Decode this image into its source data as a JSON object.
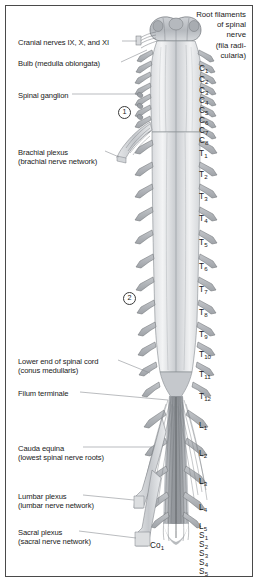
{
  "figure": {
    "border_color": "#4a4a4a",
    "background": "#ffffff",
    "ink_color": "#1a1a1a",
    "structure_fill": "#b9bcc0",
    "structure_light": "#e3e5e7",
    "leader_color": "#7b7f84"
  },
  "header": {
    "lines": [
      "Root filaments",
      "of spinal",
      "nerve",
      "(fila radi-",
      "cularia)"
    ]
  },
  "callouts": [
    {
      "name": "cranial-nerves",
      "lines": [
        "Cranial nerves IX, X, and XI"
      ],
      "x": 18,
      "y": 38,
      "leader_from": 146,
      "leader_to": 160,
      "leader_y": 41
    },
    {
      "name": "bulb",
      "lines": [
        "Bulb (medulla oblongata)"
      ],
      "x": 18,
      "y": 59,
      "leader_from": 129,
      "leader_to": 158,
      "leader_y": 62
    },
    {
      "name": "spinal-ganglion",
      "lines": [
        "Spinal ganglion"
      ],
      "x": 18,
      "y": 91,
      "leader_from": 80,
      "leader_to": 146,
      "leader_y": 94
    },
    {
      "name": "brachial-plexus",
      "lines": [
        "Brachial plexus",
        "(brachial nerve network)"
      ],
      "x": 18,
      "y": 148,
      "leader_from": 113,
      "leader_to": 137,
      "leader_y": 151
    },
    {
      "name": "conus-medullaris",
      "lines": [
        "Lower end of spinal cord",
        "(conus medullaris)"
      ],
      "x": 18,
      "y": 357,
      "leader_from": 126,
      "leader_to": 148,
      "leader_y": 360
    },
    {
      "name": "filum-terminale",
      "lines": [
        "Filum terminale"
      ],
      "x": 18,
      "y": 389,
      "leader_from": 85,
      "leader_to": 152,
      "leader_y": 392
    },
    {
      "name": "cauda-equina",
      "lines": [
        "Cauda equina",
        "(lowest spinal nerve roots)"
      ],
      "x": 18,
      "y": 444,
      "leader_from": 90,
      "leader_to": 144,
      "leader_y": 447
    },
    {
      "name": "lumbar-plexus",
      "lines": [
        "Lumbar plexus",
        "(lumbar nerve network)"
      ],
      "x": 18,
      "y": 492,
      "leader_from": 90,
      "leader_to": 134,
      "leader_y": 495
    },
    {
      "name": "sacral-plexus",
      "lines": [
        "Sacral plexus",
        "(sacral nerve network)"
      ],
      "x": 18,
      "y": 528,
      "leader_from": 86,
      "leader_to": 136,
      "leader_y": 531
    }
  ],
  "region_markers": [
    {
      "label": "1",
      "x": 118,
      "y": 106
    },
    {
      "label": "2",
      "x": 123,
      "y": 292
    }
  ],
  "segments": [
    {
      "letter": "C",
      "index": "1",
      "x": 199,
      "y": 64
    },
    {
      "letter": "C",
      "index": "2",
      "x": 199,
      "y": 75
    },
    {
      "letter": "C",
      "index": "3",
      "x": 199,
      "y": 86
    },
    {
      "letter": "C",
      "index": "4",
      "x": 199,
      "y": 96
    },
    {
      "letter": "C",
      "index": "5",
      "x": 199,
      "y": 106
    },
    {
      "letter": "C",
      "index": "6",
      "x": 199,
      "y": 116
    },
    {
      "letter": "C",
      "index": "7",
      "x": 199,
      "y": 126
    },
    {
      "letter": "C",
      "index": "8",
      "x": 199,
      "y": 136
    },
    {
      "letter": "T",
      "index": "1",
      "x": 199,
      "y": 149
    },
    {
      "letter": "T",
      "index": "2",
      "x": 199,
      "y": 170
    },
    {
      "letter": "T",
      "index": "3",
      "x": 199,
      "y": 192
    },
    {
      "letter": "T",
      "index": "4",
      "x": 199,
      "y": 214
    },
    {
      "letter": "T",
      "index": "5",
      "x": 199,
      "y": 238
    },
    {
      "letter": "T",
      "index": "6",
      "x": 199,
      "y": 262
    },
    {
      "letter": "T",
      "index": "7",
      "x": 199,
      "y": 285
    },
    {
      "letter": "T",
      "index": "8",
      "x": 199,
      "y": 308
    },
    {
      "letter": "T",
      "index": "9",
      "x": 199,
      "y": 330
    },
    {
      "letter": "T",
      "index": "10",
      "x": 199,
      "y": 350
    },
    {
      "letter": "T",
      "index": "11",
      "x": 199,
      "y": 370
    },
    {
      "letter": "T",
      "index": "12",
      "x": 199,
      "y": 392
    },
    {
      "letter": "L",
      "index": "1",
      "x": 199,
      "y": 421
    },
    {
      "letter": "L",
      "index": "2",
      "x": 199,
      "y": 449
    },
    {
      "letter": "L",
      "index": "3",
      "x": 199,
      "y": 477
    },
    {
      "letter": "L",
      "index": "4",
      "x": 199,
      "y": 503
    },
    {
      "letter": "L",
      "index": "5",
      "x": 199,
      "y": 522
    },
    {
      "letter": "S",
      "index": "1",
      "x": 199,
      "y": 531
    },
    {
      "letter": "S",
      "index": "2",
      "x": 199,
      "y": 540
    },
    {
      "letter": "S",
      "index": "3",
      "x": 199,
      "y": 549
    },
    {
      "letter": "S",
      "index": "4",
      "x": 199,
      "y": 558
    },
    {
      "letter": "S",
      "index": "5",
      "x": 199,
      "y": 567
    },
    {
      "letter": "Co",
      "index": "1",
      "x": 150,
      "y": 541
    }
  ]
}
